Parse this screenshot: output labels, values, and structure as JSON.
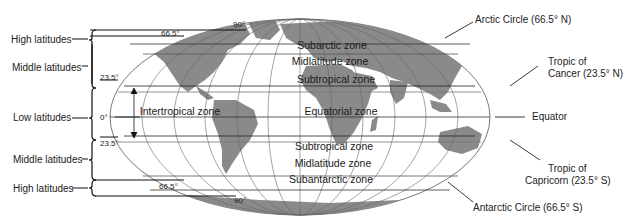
{
  "diagram": {
    "type": "world-latitude-zones",
    "left_labels": [
      {
        "id": "high-n",
        "label": "High latitudes"
      },
      {
        "id": "mid-n",
        "label": "Middle latitudes"
      },
      {
        "id": "low",
        "label": "Low latitudes"
      },
      {
        "id": "mid-s",
        "label": "Middle latitudes"
      },
      {
        "id": "high-s",
        "label": "High latitudes"
      }
    ],
    "degree_marks": {
      "n90": "90°",
      "n66": "66.5°",
      "n23": "23.5°",
      "eq": "0°",
      "s23": "23.5°",
      "s66": "66.5°",
      "s90": "90°"
    },
    "zones": {
      "subarctic": "Subarctic zone",
      "midlatitude_n": "Midlatitude zone",
      "subtropical_n": "Subtropical zone",
      "intertropical": "Intertropical zone",
      "equatorial": "Equatorial zone",
      "subtropical_s": "Subtropical zone",
      "midlatitude_s": "Midlatitude zone",
      "subantarctic": "Subantarctic zone"
    },
    "right_labels": {
      "arctic": "Arctic Circle (66.5° N)",
      "cancer_1": "Tropic of",
      "cancer_2": "Cancer (23.5° N)",
      "equator": "Equator",
      "capricorn_1": "Tropic of",
      "capricorn_2": "Capricorn (23.5° S)",
      "antarctic": "Antarctic Circle (66.5° S)"
    },
    "colors": {
      "land": "#8a8a8a",
      "ocean": "#ffffff",
      "lines": "#222222",
      "grid": "#555555"
    }
  }
}
